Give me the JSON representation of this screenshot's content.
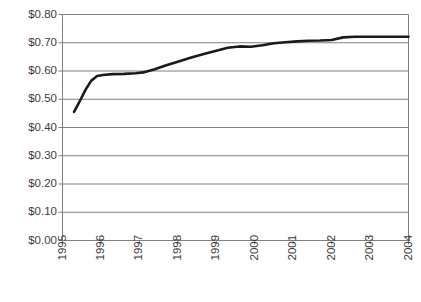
{
  "chart_data": {
    "type": "line",
    "title": "",
    "subtitle": "",
    "xlabel": "",
    "ylabel": "",
    "grid": "horizontal",
    "legend": "none",
    "xlim": [
      1995,
      2004
    ],
    "ylim": [
      0.0,
      0.8
    ],
    "y_ticks": [
      0.0,
      0.1,
      0.2,
      0.3,
      0.4,
      0.5,
      0.6,
      0.7,
      0.8
    ],
    "y_tick_labels": [
      "$0.00",
      "$0.10",
      "$0.20",
      "$0.30",
      "$0.40",
      "$0.50",
      "$0.60",
      "$0.70",
      "$0.80"
    ],
    "x_ticks": [
      1995,
      1996,
      1997,
      1998,
      1999,
      2000,
      2001,
      2002,
      2003,
      2004
    ],
    "x_tick_labels": [
      "1995",
      "1996",
      "1997",
      "1998",
      "1999",
      "2000",
      "2001",
      "2002",
      "2003",
      "2004"
    ],
    "series": [
      {
        "name": "price",
        "color": "#1a1a1a",
        "line_width": 2.6,
        "x": [
          1995.3,
          1995.45,
          1995.6,
          1995.75,
          1995.9,
          1996.05,
          1996.3,
          1996.6,
          1996.9,
          1997.1,
          1997.4,
          1997.7,
          1998.0,
          1998.35,
          1998.7,
          1999.0,
          1999.3,
          1999.6,
          1999.9,
          2000.2,
          2000.5,
          2000.8,
          2001.1,
          2001.4,
          2001.7,
          2002.0,
          2002.3,
          2002.6,
          2002.9,
          2003.2,
          2003.6,
          2004.0
        ],
        "y": [
          0.455,
          0.493,
          0.534,
          0.566,
          0.582,
          0.586,
          0.589,
          0.59,
          0.592,
          0.595,
          0.606,
          0.62,
          0.633,
          0.648,
          0.661,
          0.672,
          0.682,
          0.687,
          0.686,
          0.691,
          0.698,
          0.702,
          0.705,
          0.707,
          0.708,
          0.71,
          0.719,
          0.721,
          0.721,
          0.721,
          0.721,
          0.721
        ]
      }
    ]
  },
  "axes_style": {
    "gridline_color": "#808080",
    "axis_color": "#808080",
    "tick_color": "#808080",
    "plot_bg": "#ffffff"
  }
}
